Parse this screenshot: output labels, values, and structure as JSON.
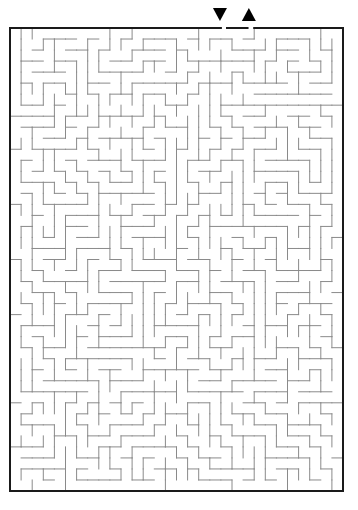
{
  "puzzle": {
    "type": "maze",
    "grid": {
      "cols": 30,
      "rows": 42
    },
    "bounds": {
      "x": 10,
      "y": 28,
      "width": 333,
      "height": 463
    },
    "colors": {
      "border": "#1a1a1a",
      "wall": "#8a8a8a",
      "marker": "#000000",
      "background": "#ffffff"
    },
    "entrance": {
      "label": "start",
      "icon": "down-triangle-icon",
      "glyph": "▼",
      "col": 19
    },
    "exit": {
      "label": "finish",
      "icon": "up-triangle-icon",
      "glyph": "▲",
      "col": 21
    },
    "seed": 7331
  }
}
